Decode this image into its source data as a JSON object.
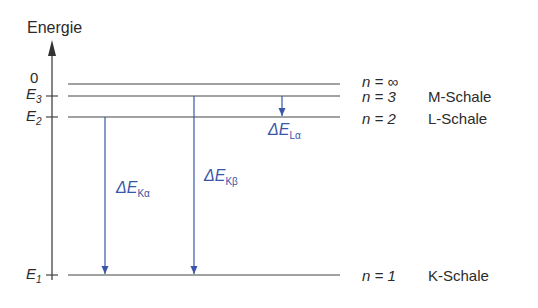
{
  "axis": {
    "label": "Energie"
  },
  "levels": [
    {
      "id": "inf",
      "tick": "0",
      "n_label": "n = ∞",
      "shell": ""
    },
    {
      "id": "3",
      "tick_E": "E",
      "tick_sub": "3",
      "n_label": "n = 3",
      "shell": "M-Schale"
    },
    {
      "id": "2",
      "tick_E": "E",
      "tick_sub": "2",
      "n_label": "n = 2",
      "shell": "L-Schale"
    },
    {
      "id": "1",
      "tick_E": "E",
      "tick_sub": "1",
      "n_label": "n = 1",
      "shell": "K-Schale"
    }
  ],
  "transitions": [
    {
      "id": "K-alpha",
      "prefix": "ΔE",
      "sub": "Kα"
    },
    {
      "id": "K-beta",
      "prefix": "ΔE",
      "sub": "Kβ"
    },
    {
      "id": "L-alpha",
      "prefix": "ΔE",
      "sub": "Lα"
    }
  ],
  "colors": {
    "lines": "#444444",
    "arrows": "#3a56a8"
  }
}
